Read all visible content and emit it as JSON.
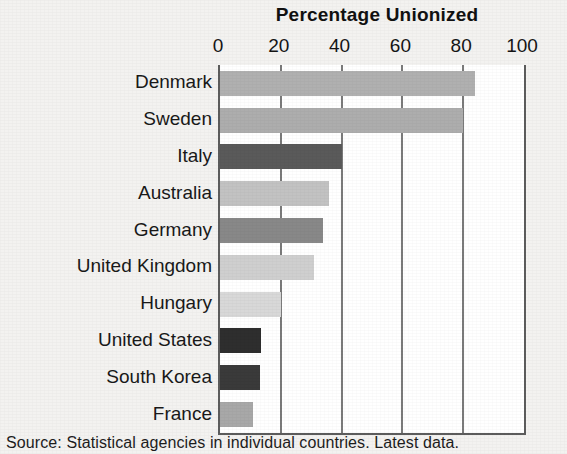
{
  "chart_data": {
    "type": "bar",
    "orientation": "horizontal",
    "title": "Percentage Unionized",
    "xlabel": "",
    "ylabel": "",
    "xlim": [
      0,
      100
    ],
    "xticks": [
      0,
      20,
      40,
      60,
      80,
      100
    ],
    "xtick_labels": [
      "0",
      "20",
      "40",
      "60",
      "80",
      "100"
    ],
    "grid": true,
    "legend": "none",
    "categories": [
      "Denmark",
      "Sweden",
      "Italy",
      "Australia",
      "Germany",
      "United Kingdom",
      "Hungary",
      "United States",
      "South Korea",
      "France"
    ],
    "values": [
      84,
      80,
      40,
      36,
      34,
      31,
      20,
      13.5,
      13,
      11
    ],
    "bar_colors": [
      "#b0b0b0",
      "#adadad",
      "#5a5a5a",
      "#c2c2c2",
      "#888888",
      "#cfcfcf",
      "#d8d8d8",
      "#2e2e2e",
      "#3a3a3a",
      "#a8a8a8"
    ],
    "bars": [
      {
        "category": "Denmark",
        "value": 84,
        "color": "#b0b0b0"
      },
      {
        "category": "Sweden",
        "value": 80,
        "color": "#adadad"
      },
      {
        "category": "Italy",
        "value": 40,
        "color": "#5a5a5a"
      },
      {
        "category": "Australia",
        "value": 36,
        "color": "#c2c2c2"
      },
      {
        "category": "Germany",
        "value": 34,
        "color": "#888888"
      },
      {
        "category": "United Kingdom",
        "value": 31,
        "color": "#cfcfcf"
      },
      {
        "category": "Hungary",
        "value": 20,
        "color": "#d8d8d8"
      },
      {
        "category": "United States",
        "value": 13.5,
        "color": "#2e2e2e"
      },
      {
        "category": "South Korea",
        "value": 13,
        "color": "#3a3a3a"
      },
      {
        "category": "France",
        "value": 11,
        "color": "#a8a8a8"
      }
    ],
    "source_note": "Source: Statistical agencies in individual countries. Latest data."
  },
  "figure": {
    "background_color": "#f3f2f0",
    "plot_background_color": "#ffffff",
    "axis_color": "#5c5c5c"
  }
}
